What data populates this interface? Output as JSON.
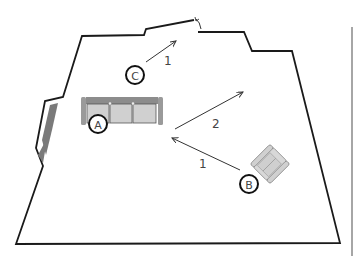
{
  "diagram": {
    "type": "floor-plan",
    "colors": {
      "wall": "#1a1a1a",
      "window": "#7a7a7a",
      "furniture_fill": "#d0d0d0",
      "furniture_stroke": "#8a8a8a",
      "sofa_back": "#8c8c8c",
      "arrow": "#333333",
      "side_bar": "#888888"
    },
    "positions": [
      {
        "id": "A",
        "label": "A",
        "description": "seat on sofa"
      },
      {
        "id": "B",
        "label": "B",
        "description": "armchair"
      },
      {
        "id": "C",
        "label": "C",
        "description": "standing position"
      }
    ],
    "arrows": [
      {
        "from": "C",
        "label": "1"
      },
      {
        "from": "center",
        "label": "2"
      },
      {
        "from": "B",
        "label": "1"
      }
    ]
  }
}
